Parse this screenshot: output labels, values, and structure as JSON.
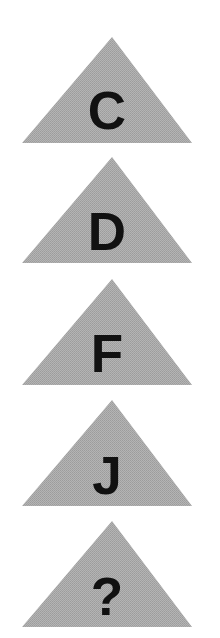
{
  "puzzle": {
    "fill_color": "#a9a9a9",
    "letter_color": "#111111",
    "triangles": [
      {
        "label": "C",
        "top": 37
      },
      {
        "label": "D",
        "top": 157
      },
      {
        "label": "F",
        "top": 279
      },
      {
        "label": "J",
        "top": 400
      },
      {
        "label": "?",
        "top": 521
      }
    ]
  }
}
